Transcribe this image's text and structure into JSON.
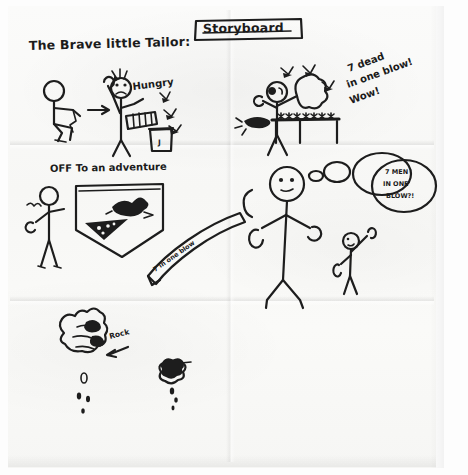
{
  "sheet": {
    "medium": "hand-drawn pencil storyboard on folded white paper",
    "ink_color": "#1d1d1d",
    "paper_color": "#f8f8f6"
  },
  "header": {
    "story_title": "The Brave little Tailor:",
    "boxed_title": "Storyboard"
  },
  "panels": [
    {
      "id": "panel-1",
      "name": "tailor-gets-hungry",
      "captions": [
        "Hungry"
      ],
      "jar_label": "J",
      "figures": [
        "seated tailor sewing",
        "arrow",
        "standing tailor holding bread",
        "jam jar",
        "flies"
      ]
    },
    {
      "id": "panel-2",
      "name": "seven-in-one-blow",
      "captions": [
        "7 dead",
        "in one blow!",
        "Wow!"
      ],
      "figures": [
        "tailor swatting",
        "table with seven dead flies",
        "jam blob",
        "flies"
      ]
    },
    {
      "id": "panel-3",
      "name": "off-to-an-adventure",
      "captions": [
        "OFF To an adventure"
      ],
      "belt_text": "7 in one blow",
      "figures": [
        "tailor waving",
        "satchel with bird and cheese",
        "belt banner"
      ]
    },
    {
      "id": "panel-4",
      "name": "giant-meets-tailor",
      "thought_bubble": "7 MEN IN ONE BLOW?!",
      "figures": [
        "giant stick figure",
        "small tailor with raised arm",
        "thought bubble"
      ]
    },
    {
      "id": "panel-5",
      "name": "squeezing-the-rock",
      "captions": [
        "Rock"
      ],
      "figures": [
        "giant hand squeezing rock",
        "drips",
        "tailor hand squeezing cheese",
        "drips"
      ]
    }
  ],
  "annotations": {
    "arrow_rock": "arrow pointing at rock",
    "drips_count_left": 4,
    "drips_count_right": 3,
    "flies_total_on_table": 7
  }
}
